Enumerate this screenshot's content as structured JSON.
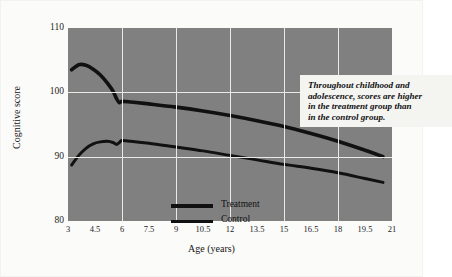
{
  "chart_data": {
    "type": "line",
    "title": "",
    "xlabel": "Age (years)",
    "ylabel": "Cognitive score",
    "xlim": [
      3,
      21
    ],
    "ylim": [
      80,
      110
    ],
    "yticks": [
      80,
      90,
      100,
      110
    ],
    "xticks": [
      "3",
      "4.5",
      "6",
      "7.5",
      "9",
      "10.5",
      "12",
      "13.5",
      "15",
      "16.5",
      "18",
      "19.5",
      "21"
    ],
    "xtick_values": [
      3,
      4.5,
      6,
      7.5,
      9,
      10.5,
      12,
      13.5,
      15,
      16.5,
      18,
      19.5,
      21
    ],
    "grid": "x-gridlines at 6, 9, 12, 15, 18; y-gridlines at 90 and 100",
    "xgrid_values": [
      6,
      9,
      12,
      15,
      18
    ],
    "ygrid_values": [
      90,
      100
    ],
    "plot_background": "#808080",
    "grid_color": "#e9e9e6",
    "line_color": "#111111",
    "legend_position": "inside lower-left",
    "series": [
      {
        "name": "Treatment",
        "x": [
          3.2,
          3.6,
          4.0,
          4.4,
          4.8,
          5.2,
          5.5,
          5.7,
          5.85,
          6.0,
          6.5,
          7.5,
          9.0,
          10.5,
          12.0,
          13.5,
          15.0,
          16.5,
          18.0,
          19.5,
          20.5
        ],
        "y": [
          103.5,
          104.3,
          104.2,
          103.6,
          102.7,
          101.4,
          100.2,
          99.0,
          98.4,
          98.6,
          98.5,
          98.2,
          97.7,
          97.1,
          96.4,
          95.6,
          94.7,
          93.6,
          92.4,
          91.0,
          90.0
        ]
      },
      {
        "name": "Control",
        "x": [
          3.2,
          3.6,
          4.0,
          4.4,
          4.8,
          5.2,
          5.5,
          5.7,
          5.85,
          6.0,
          6.5,
          7.5,
          9.0,
          10.5,
          12.0,
          13.5,
          15.0,
          16.5,
          18.0,
          19.5,
          20.5
        ],
        "y": [
          88.7,
          90.2,
          91.3,
          92.0,
          92.3,
          92.4,
          92.2,
          91.9,
          92.2,
          92.5,
          92.4,
          92.1,
          91.5,
          90.9,
          90.2,
          89.5,
          88.8,
          88.2,
          87.5,
          86.6,
          86.0
        ]
      }
    ],
    "annotations": [
      {
        "name": "callout",
        "lines": [
          "Throughout childhood and",
          "adolescence, scores are higher",
          "in the treatment group than",
          "in the control group."
        ]
      }
    ]
  },
  "legend": {
    "items": [
      {
        "label": "Treatment",
        "thickness": 4
      },
      {
        "label": "Control",
        "thickness": 3
      }
    ]
  }
}
